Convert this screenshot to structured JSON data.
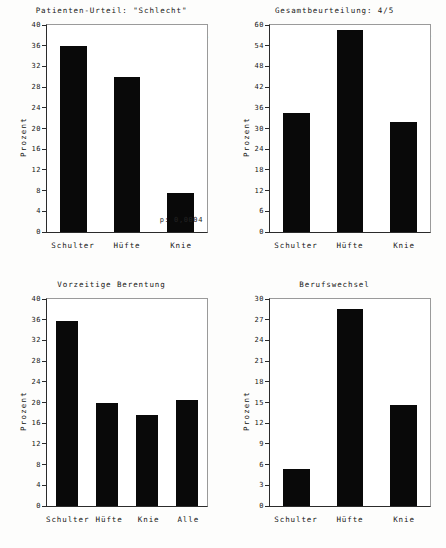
{
  "figure": {
    "panels": [
      {
        "tag": "4-A",
        "title": "Patienten-Urteil: \"Schlecht\"",
        "ylabel": "Prozent",
        "annotation": "p: 0,0004",
        "chart_data": {
          "type": "bar",
          "title": "Patienten-Urteil: \"Schlecht\"",
          "xlabel": "",
          "ylabel": "Prozent",
          "categories": [
            "Schulter",
            "Hüfte",
            "Knie"
          ],
          "values": [
            36.0,
            30.0,
            7.5
          ],
          "ylim": [
            0,
            40
          ],
          "yticks": [
            0,
            4,
            8,
            12,
            16,
            20,
            24,
            28,
            32,
            36,
            40
          ],
          "ytick_labels": [
            "0",
            "4",
            "8",
            "12",
            "16",
            "20",
            "24",
            "28",
            "32",
            "36",
            "40"
          ],
          "grid": false,
          "legend": "none",
          "annotations": [
            "p: 0,0004"
          ]
        }
      },
      {
        "tag": "4-B",
        "title": "Gesamtbeurteilung: 4/5",
        "ylabel": "Prozent",
        "annotation": "",
        "chart_data": {
          "type": "bar",
          "title": "Gesamtbeurteilung: 4/5",
          "xlabel": "",
          "ylabel": "Prozent",
          "categories": [
            "Schulter",
            "Hüfte",
            "Knie"
          ],
          "values": [
            34.5,
            58.5,
            32.0
          ],
          "ylim": [
            0,
            60
          ],
          "yticks": [
            0,
            6,
            12,
            18,
            24,
            30,
            36,
            42,
            48,
            54,
            60
          ],
          "ytick_labels": [
            "0",
            "6",
            "12",
            "18",
            "24",
            "30",
            "36",
            "42",
            "48",
            "54",
            "60"
          ],
          "grid": false,
          "legend": "none",
          "annotations": []
        }
      },
      {
        "tag": "4-C",
        "title": "Vorzeitige Berentung",
        "ylabel": "Prozent",
        "annotation": "",
        "chart_data": {
          "type": "bar",
          "title": "Vorzeitige Berentung",
          "xlabel": "",
          "ylabel": "Prozent",
          "categories": [
            "Schulter",
            "Hüfte",
            "Knie",
            "Alle"
          ],
          "values": [
            35.7,
            20.0,
            17.6,
            20.5
          ],
          "ylim": [
            0,
            40
          ],
          "yticks": [
            0,
            4,
            8,
            12,
            16,
            20,
            24,
            28,
            32,
            36,
            40
          ],
          "ytick_labels": [
            "0",
            "4",
            "8",
            "12",
            "16",
            "20",
            "24",
            "28",
            "32",
            "36",
            "40"
          ],
          "grid": false,
          "legend": "none",
          "annotations": []
        }
      },
      {
        "tag": "4-D",
        "title": "Berufswechsel",
        "ylabel": "Prozent",
        "annotation": "",
        "chart_data": {
          "type": "bar",
          "title": "Berufswechsel",
          "xlabel": "",
          "ylabel": "Prozent",
          "categories": [
            "Schulter",
            "Hüfte",
            "Knie"
          ],
          "values": [
            5.3,
            28.5,
            14.7
          ],
          "ylim": [
            0,
            30
          ],
          "yticks": [
            0,
            3,
            6,
            9,
            12,
            15,
            18,
            21,
            24,
            27,
            30
          ],
          "ytick_labels": [
            "0",
            "3",
            "6",
            "9",
            "12",
            "15",
            "18",
            "21",
            "24",
            "27",
            "30"
          ],
          "grid": false,
          "legend": "none",
          "annotations": []
        }
      }
    ],
    "colors": {
      "bar": "#090909",
      "axis": "#2b2b2b",
      "text": "#151515",
      "background": "#ffffff"
    }
  }
}
